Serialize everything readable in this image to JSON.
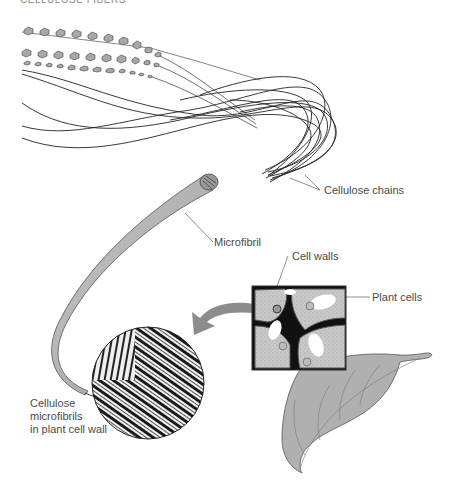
{
  "figure": {
    "top_caption_cut": "CELLULOSE FIBERS",
    "labels": {
      "cellulose_chains": "Cellulose chains",
      "microfibril": "Microfibril",
      "cell_walls": "Cell walls",
      "plant_cells": "Plant cells",
      "micrograph_caption": [
        "Cellulose",
        "microfibrils",
        "in plant cell wall"
      ]
    },
    "elements": {
      "glucose_chains": 3,
      "cellulose_strands": "bundle of fibers emerging from microfibril end",
      "micrograph": "circular electron micrograph of crossed fiber layers",
      "arrow": "curved gray arrow from cell box to micrograph",
      "cell_box": "magnified section of plant cells with thick cell walls",
      "leaf": "gray leaf with veins"
    },
    "colors": {
      "line": "#222222",
      "ring_fill": "#a8a8a8",
      "microfibril": "#b5b5b5",
      "arrow": "#8c8c8c",
      "leaf": "#b0b0b0",
      "cell_fill": "#c8c8c8",
      "label": "#4a4a4a"
    }
  }
}
